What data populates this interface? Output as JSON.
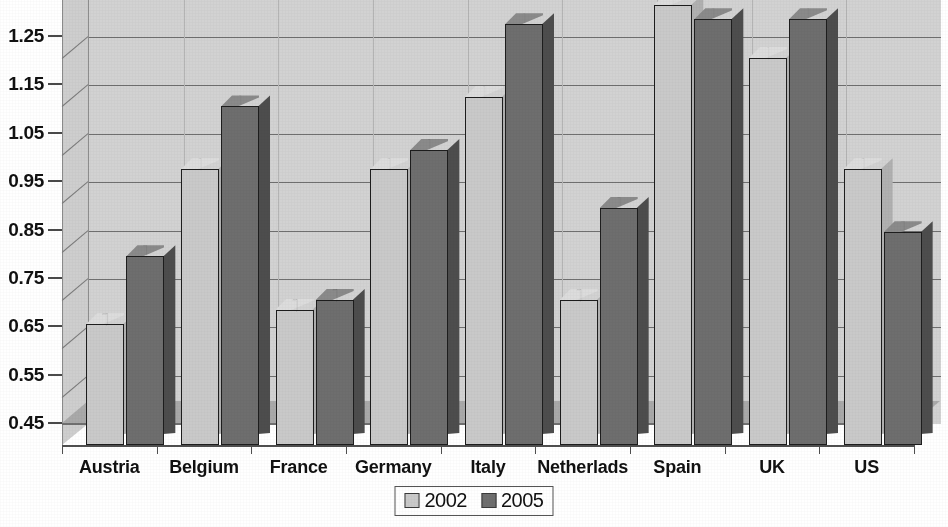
{
  "chart_data": {
    "type": "bar",
    "title": "",
    "xlabel": "",
    "ylabel": "",
    "categories": [
      "Austria",
      "Belgium",
      "France",
      "Germany",
      "Italy",
      "Netherlads",
      "Spain",
      "UK",
      "US"
    ],
    "series": [
      {
        "name": "2002",
        "color": "#c9c9c9",
        "values": [
          0.7,
          1.02,
          0.73,
          1.02,
          1.17,
          0.75,
          1.36,
          1.25,
          1.02
        ]
      },
      {
        "name": "2005",
        "color": "#6e6e6e",
        "values": [
          0.84,
          1.15,
          0.75,
          1.06,
          1.32,
          0.94,
          1.33,
          1.33,
          0.89
        ]
      }
    ],
    "ylim": [
      0.45,
      1.37
    ],
    "yticks": [
      0.45,
      0.55,
      0.65,
      0.75,
      0.85,
      0.95,
      1.05,
      1.15,
      1.25
    ],
    "ytick_labels": [
      "0.45",
      "0.55",
      "0.65",
      "0.75",
      "0.85",
      "0.95",
      "1.05",
      "1.15",
      "1.25"
    ],
    "grid": true,
    "legend_position": "bottom",
    "style": "3d-bar",
    "note_top_label_clipped": "1.35"
  },
  "legend": {
    "items": [
      {
        "label": "2002",
        "color": "#c9c9c9"
      },
      {
        "label": "2005",
        "color": "#6e6e6e"
      }
    ]
  },
  "colors": {
    "series_2002": "#c9c9c9",
    "series_2005": "#6e6e6e",
    "back_wall": "#d2d2d2",
    "side_wall": "#cecece",
    "floor": "#a9a9a9",
    "gridline": "#6f6f6f",
    "text": "#111111",
    "background": "#ffffff"
  }
}
